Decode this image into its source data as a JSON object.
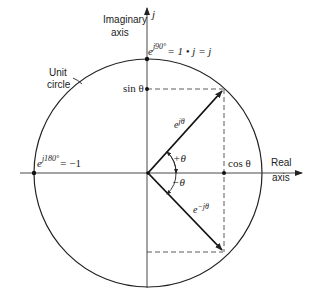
{
  "diagram": {
    "labels": {
      "imaginary_axis_line1": "Imaginary",
      "imaginary_axis_line2": "axis",
      "j_label": "j",
      "top_point": "= 1 • j = j",
      "top_point_exp": "j90°",
      "unit_circle_line1": "Unit",
      "unit_circle_line2": "circle",
      "sin_theta": "sin θ",
      "left_point": "= −1",
      "left_point_exp": "j180°",
      "e": "e",
      "e_jtheta_exp": "jθ",
      "plus_theta": "+θ",
      "minus_theta": "−θ",
      "cos_theta": "cos θ",
      "real_axis_line1": "Real",
      "real_axis_line2": "axis",
      "e_neg_jtheta_exp": "−jθ"
    },
    "colors": {
      "stroke": "#222222",
      "background": "#ffffff"
    }
  }
}
